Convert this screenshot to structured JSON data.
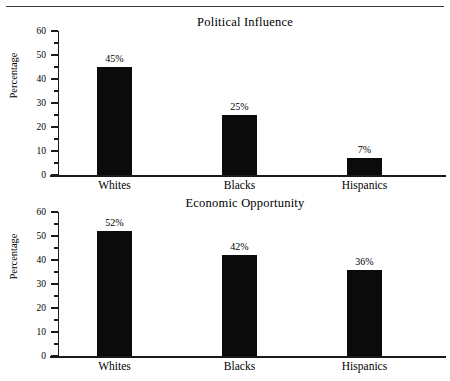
{
  "figure": {
    "background_color": "#ffffff",
    "bar_color": "#0b0b0b",
    "axis_color": "#1a1a1a",
    "top_rule": "horizontal-rule"
  },
  "charts": [
    {
      "title": "Political Influence",
      "ylabel": "Percentage",
      "ytick_labels": [
        "0",
        "10",
        "20",
        "30",
        "40",
        "50",
        "60"
      ],
      "categories": [
        "Whites",
        "Blacks",
        "Hispanics"
      ],
      "value_labels": [
        "45%",
        "25%",
        "7%"
      ]
    },
    {
      "title": "Economic Opportunity",
      "ylabel": "Percentage",
      "ytick_labels": [
        "0",
        "10",
        "20",
        "30",
        "40",
        "50",
        "60"
      ],
      "categories": [
        "Whites",
        "Blacks",
        "Hispanics"
      ],
      "value_labels": [
        "52%",
        "42%",
        "36%"
      ]
    }
  ],
  "chart_data": [
    {
      "type": "bar",
      "title": "Political Influence",
      "xlabel": "",
      "ylabel": "Percentage",
      "categories": [
        "Whites",
        "Blacks",
        "Hispanics"
      ],
      "values": [
        45,
        25,
        7
      ],
      "data_labels": [
        "45%",
        "25%",
        "7%"
      ],
      "ylim": [
        0,
        60
      ],
      "ytick_major": [
        0,
        10,
        20,
        30,
        40,
        50,
        60
      ],
      "ytick_minor": [
        5,
        15,
        25,
        35,
        45,
        55
      ],
      "grid": false,
      "legend": "none",
      "bar_color": "#0b0b0b"
    },
    {
      "type": "bar",
      "title": "Economic Opportunity",
      "xlabel": "",
      "ylabel": "Percentage",
      "categories": [
        "Whites",
        "Blacks",
        "Hispanics"
      ],
      "values": [
        52,
        42,
        36
      ],
      "data_labels": [
        "52%",
        "42%",
        "36%"
      ],
      "ylim": [
        0,
        60
      ],
      "ytick_major": [
        0,
        10,
        20,
        30,
        40,
        50,
        60
      ],
      "ytick_minor": [
        5,
        15,
        25,
        35,
        45,
        55
      ],
      "grid": false,
      "legend": "none",
      "bar_color": "#0b0b0b"
    }
  ]
}
